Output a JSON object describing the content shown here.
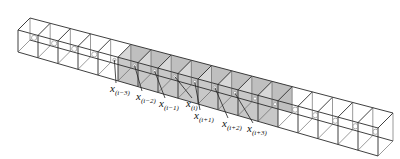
{
  "diagram": {
    "cube_count": 18,
    "shaded_range": [
      5,
      13
    ],
    "colors": {
      "edge": "#2a2a2a",
      "shade": "#c8c8c8",
      "point": "#bbbbbb",
      "background": "#ffffff"
    },
    "labels": [
      {
        "base": "x",
        "sub": "(i−3)",
        "x": 110,
        "y": 83
      },
      {
        "base": "x",
        "sub": "(i−2)",
        "x": 136,
        "y": 91
      },
      {
        "base": "x",
        "sub": "(i−1)",
        "x": 159,
        "y": 98
      },
      {
        "base": "x",
        "sub": "(i)",
        "x": 186,
        "y": 98
      },
      {
        "base": "x",
        "sub": "(i+1)",
        "x": 194,
        "y": 110
      },
      {
        "base": "x",
        "sub": "(i+2)",
        "x": 222,
        "y": 118
      },
      {
        "base": "x",
        "sub": "(i+3)",
        "x": 247,
        "y": 123
      }
    ]
  }
}
